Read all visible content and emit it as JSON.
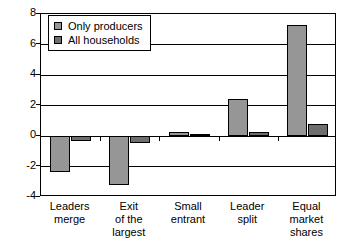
{
  "chart_data": {
    "type": "bar",
    "title": "",
    "xlabel": "",
    "ylabel": "",
    "categories": [
      "Leaders merge",
      "Exit of the largest",
      "Small entrant",
      "Leader split",
      "Equal market shares"
    ],
    "category_lines": [
      [
        "Leaders",
        "merge"
      ],
      [
        "Exit",
        "of the",
        "largest"
      ],
      [
        "Small",
        "entrant"
      ],
      [
        "Leader",
        "split"
      ],
      [
        "Equal",
        "market",
        "shares"
      ]
    ],
    "series": [
      {
        "name": "Only producers",
        "color": "#969696",
        "values": [
          -2.35,
          -3.2,
          0.25,
          2.4,
          7.3
        ]
      },
      {
        "name": "All households",
        "color": "#6e6e6e",
        "values": [
          -0.35,
          -0.45,
          0.02,
          0.25,
          0.8
        ]
      }
    ],
    "ylim": [
      -4,
      8
    ],
    "yticks": [
      8,
      6,
      4,
      2,
      0,
      -2,
      -4
    ],
    "ytick_labels": [
      "8",
      "6",
      "4",
      "2",
      "0",
      "-2",
      "-4"
    ],
    "grid": true,
    "legend_position": "top-left",
    "legend_entries": [
      "Only producers",
      "All households"
    ]
  }
}
